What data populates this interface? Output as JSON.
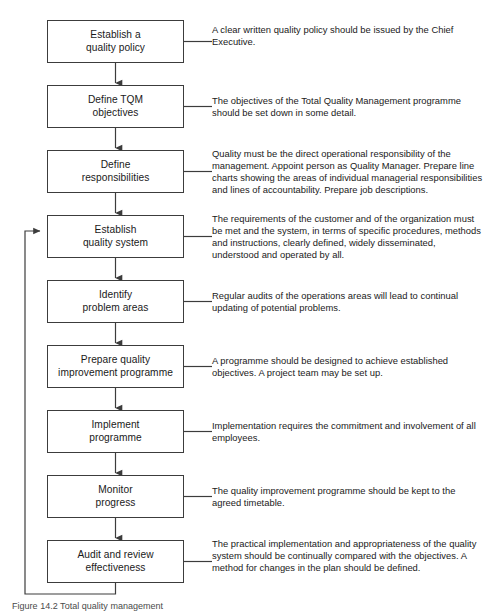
{
  "figure": {
    "caption": "Figure 14.2 Total quality management",
    "header_faint": ""
  },
  "diagram": {
    "type": "flowchart",
    "orientation": "vertical",
    "box_border_color": "#3c3c3c",
    "line_color": "#3c3c3c",
    "text_color": "#1a1a1a",
    "feedback_loop": {
      "from_step": 9,
      "to_step": 4,
      "label": ""
    },
    "steps": [
      {
        "index": 1,
        "label": "Establish a\nquality policy",
        "note": "A clear written quality policy should be issued by the Chief Executive."
      },
      {
        "index": 2,
        "label": "Define TQM\nobjectives",
        "note": "The objectives of the Total Quality Management programme should be set down in some detail."
      },
      {
        "index": 3,
        "label": "Define\nresponsibilities",
        "note": "Quality must be the direct operational responsibility of the management. Appoint person as Quality Manager. Prepare line charts showing the areas of individual managerial responsibilities and lines of accountability. Prepare job descriptions."
      },
      {
        "index": 4,
        "label": "Establish\nquality system",
        "note": "The requirements of the customer and of the organization must be met and the system, in terms of specific procedures, methods and instructions, clearly defined, widely disseminated, understood and operated by all."
      },
      {
        "index": 5,
        "label": "Identify\nproblem areas",
        "note": "Regular audits of the operations areas will lead to continual updating of potential problems."
      },
      {
        "index": 6,
        "label": "Prepare quality\nimprovement programme",
        "note": "A programme should be designed to achieve established objectives. A project team may be set up."
      },
      {
        "index": 7,
        "label": "Implement\nprogramme",
        "note": "Implementation requires the commitment and involvement of all employees."
      },
      {
        "index": 8,
        "label": "Monitor\nprogress",
        "note": "The quality improvement programme should be kept to the agreed timetable."
      },
      {
        "index": 9,
        "label": "Audit and review\neffectiveness",
        "note": "The practical implementation and appropriateness of the quality system should be continually compared with the objectives. A method for changes in the plan should be defined."
      }
    ]
  }
}
